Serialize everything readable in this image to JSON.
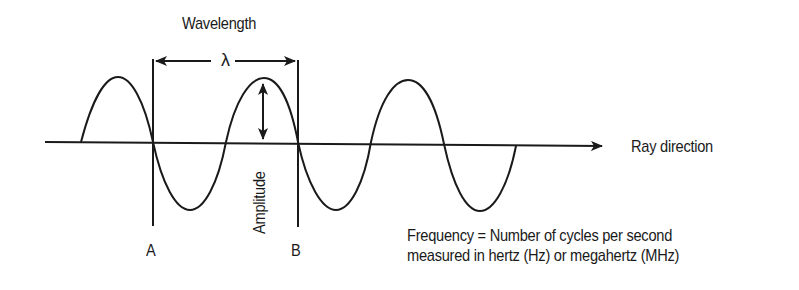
{
  "diagram": {
    "title": "Wavelength",
    "wavelength_symbol": "λ",
    "axis_label": "Ray direction",
    "amplitude_label": "Amplitude",
    "point_a_label": "A",
    "point_b_label": "B",
    "frequency_line1": "Frequency = Number of cycles per second",
    "frequency_line2": "measured in hertz (Hz) or megahertz (MHz)",
    "colors": {
      "stroke": "#1a1a1a",
      "background": "#ffffff"
    }
  }
}
